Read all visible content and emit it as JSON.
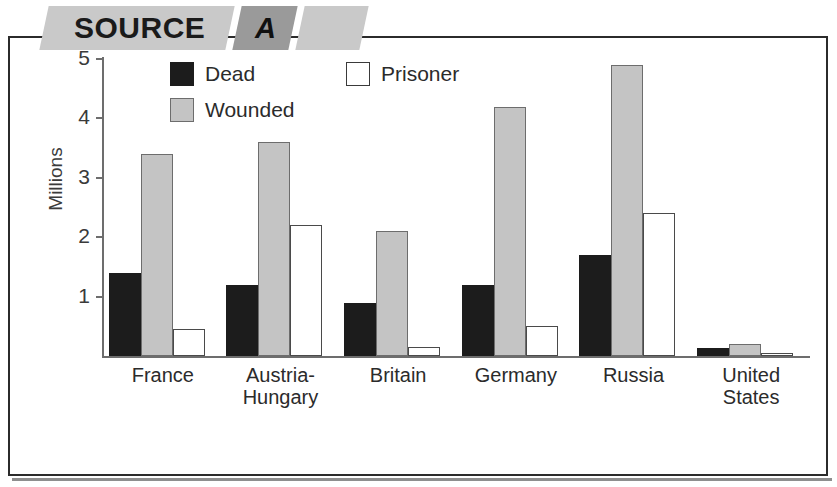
{
  "banner": {
    "source_label": "SOURCE",
    "letter_label": "A",
    "tail_label": ""
  },
  "legend": {
    "items": [
      {
        "key": "dead",
        "label": "Dead",
        "swatch": "black-square-icon",
        "color": "#1c1c1c"
      },
      {
        "key": "wounded",
        "label": "Wounded",
        "swatch": "gray-square-icon",
        "color": "#c4c4c4"
      },
      {
        "key": "prisoner",
        "label": "Prisoner",
        "swatch": "white-square-icon",
        "color": "#ffffff"
      }
    ]
  },
  "axis": {
    "y_title": "Millions",
    "y_ticks": [
      "1",
      "2",
      "3",
      "4",
      "5"
    ]
  },
  "chart_data": {
    "type": "bar",
    "title": "",
    "subtitle": "",
    "xlabel": "",
    "ylabel": "Millions",
    "ylim": [
      0,
      5.2
    ],
    "y_ticks": [
      1,
      2,
      3,
      4,
      5
    ],
    "grid": false,
    "legend_position": "top-center",
    "categories": [
      "France",
      "Austria-Hungary",
      "Britain",
      "Germany",
      "Russia",
      "United States"
    ],
    "category_lines": [
      [
        "France"
      ],
      [
        "Austria-",
        "Hungary"
      ],
      [
        "Britain"
      ],
      [
        "Germany"
      ],
      [
        "Russia"
      ],
      [
        "United",
        "States"
      ]
    ],
    "series": [
      {
        "name": "Dead",
        "color": "#1c1c1c",
        "values": [
          1.4,
          1.2,
          0.9,
          1.2,
          1.7,
          0.13
        ]
      },
      {
        "name": "Wounded",
        "color": "#c4c4c4",
        "values": [
          3.4,
          3.6,
          2.1,
          4.2,
          4.9,
          0.2
        ]
      },
      {
        "name": "Prisoner",
        "color": "#ffffff",
        "values": [
          0.45,
          2.2,
          0.15,
          0.5,
          2.4,
          0.05
        ]
      }
    ]
  }
}
